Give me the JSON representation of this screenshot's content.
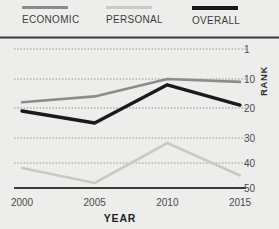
{
  "legend": {
    "items": [
      {
        "label": "ECONOMIC",
        "color": "#8c8c8a",
        "key": "economic"
      },
      {
        "label": "PERSONAL",
        "color": "#c9c9c6",
        "key": "personal"
      },
      {
        "label": "OVERALL",
        "color": "#1a1a1a",
        "key": "overall"
      }
    ]
  },
  "axes": {
    "y_title": "RANK",
    "x_title": "YEAR",
    "y_ticks": [
      "1",
      "10",
      "20",
      "30",
      "40",
      "50"
    ],
    "x_ticks": [
      "2000",
      "2005",
      "2010",
      "2015"
    ]
  },
  "colors": {
    "background": "#ededeb",
    "gridline": "#9a9a98",
    "axis": "#3a3a3a",
    "tick_text": "#4a4a4a"
  },
  "chart_data": {
    "type": "line",
    "title": "",
    "subtitle": "",
    "xlabel": "YEAR",
    "ylabel": "RANK",
    "x": [
      2000,
      2005,
      2010,
      2015
    ],
    "xlim": [
      2000,
      2015
    ],
    "ylim": [
      1,
      50
    ],
    "y_inverted": true,
    "y_ticks": [
      1,
      10,
      20,
      30,
      40,
      50
    ],
    "x_ticks": [
      2000,
      2005,
      2010,
      2015
    ],
    "grid": "horizontal-dotted",
    "legend_position": "top",
    "series": [
      {
        "name": "ECONOMIC",
        "color": "#8c8c8a",
        "width": 2.6,
        "values": [
          18,
          16,
          10,
          11
        ]
      },
      {
        "name": "PERSONAL",
        "color": "#c9c9c6",
        "width": 2.6,
        "values": [
          42,
          48,
          32,
          45
        ]
      },
      {
        "name": "OVERALL",
        "color": "#1a1a1a",
        "width": 3.4,
        "values": [
          21,
          25,
          12,
          19
        ]
      }
    ]
  }
}
